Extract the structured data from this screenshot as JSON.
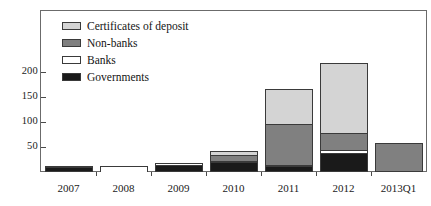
{
  "chart_data": {
    "type": "bar",
    "subtype": "stacked-bar",
    "title": "",
    "subtitle": "",
    "xlabel": "",
    "ylabel": "",
    "categories": [
      "2007",
      "2008",
      "2009",
      "2010",
      "2011",
      "2012",
      "2013Q1"
    ],
    "series": [
      {
        "name": "Governments",
        "color": "#1a1a1a",
        "values": [
          10,
          0,
          14,
          20,
          12,
          38,
          3
        ]
      },
      {
        "name": "Banks",
        "color": "#ffffff",
        "values": [
          1,
          12,
          5,
          3,
          3,
          7,
          0
        ]
      },
      {
        "name": "Non-banks",
        "color": "#808080",
        "values": [
          0,
          0,
          0,
          12,
          82,
          34,
          56
        ]
      },
      {
        "name": "Certificates of deposit",
        "color": "#d4d4d4",
        "values": [
          0,
          0,
          0,
          8,
          69,
          139,
          0
        ]
      }
    ],
    "stack_order_bottom_to_top": [
      "Governments",
      "Banks",
      "Non-banks",
      "Certificates of deposit"
    ],
    "totals": [
      11,
      12,
      19,
      43,
      166,
      218,
      59
    ],
    "ylim": [
      0,
      235
    ],
    "yticks": [
      50,
      100,
      150,
      200
    ],
    "ytick_labels": [
      "50",
      "100",
      "150",
      "200"
    ],
    "grid": false,
    "legend_position": "upper-left-inside",
    "legend_order_top_to_bottom": [
      "Certificates of deposit",
      "Non-banks",
      "Banks",
      "Governments"
    ]
  },
  "legend": {
    "items": [
      {
        "label": "Certificates of deposit",
        "color": "#d4d4d4"
      },
      {
        "label": "Non-banks",
        "color": "#808080"
      },
      {
        "label": "Banks",
        "color": "#ffffff"
      },
      {
        "label": "Governments",
        "color": "#1a1a1a"
      }
    ]
  },
  "axes": {
    "y": {
      "ticks": [
        "50",
        "100",
        "150",
        "200"
      ]
    },
    "x": {
      "ticks": [
        "2007",
        "2008",
        "2009",
        "2010",
        "2011",
        "2012",
        "2013Q1"
      ]
    }
  }
}
